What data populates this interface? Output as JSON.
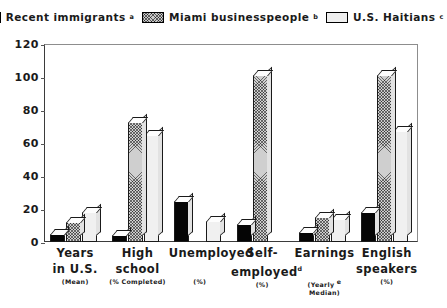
{
  "legend": {
    "entries": [
      {
        "label": "Recent immigrants",
        "sup": "a",
        "pattern": "solid-black",
        "color": "#000000"
      },
      {
        "label": "Miami businesspeople",
        "sup": "b",
        "pattern": "cross-hatch-gray",
        "color": "#c9c9c9"
      },
      {
        "label": "U.S. Haitians",
        "sup": "c",
        "pattern": "light-gray",
        "color": "#efefef"
      }
    ]
  },
  "yaxis": {
    "ticks": [
      "0",
      "20",
      "40",
      "60",
      "80",
      "100",
      "120"
    ],
    "min": 0,
    "max": 120
  },
  "categories": [
    {
      "line1": "Years",
      "line2": "in U.S.",
      "line3": "(Mean)",
      "sup": ""
    },
    {
      "line1": "High",
      "line2": "school",
      "line3": "(% Completed)",
      "sup": ""
    },
    {
      "line1": "Unemployed",
      "line2": "",
      "line3": "(%)",
      "sup": ""
    },
    {
      "line1": "Self-",
      "line2": "employed",
      "line3": "(%)",
      "sup": "d"
    },
    {
      "line1": "Earnings",
      "line2": "",
      "line3": "(Yearly\nMedian)",
      "sup": "e"
    },
    {
      "line1": "English",
      "line2": "speakers",
      "line3": "(%)",
      "sup": ""
    }
  ],
  "chart_data": {
    "type": "bar",
    "title": "",
    "xlabel": "",
    "ylabel": "",
    "ylim": [
      0,
      120
    ],
    "grid": false,
    "legend_position": "top-center",
    "categories": [
      "Years in U.S. (Mean)",
      "High school (% Completed)",
      "Unemployed (%)",
      "Self-employed (%)",
      "Earnings (Yearly Median)",
      "English speakers (%)"
    ],
    "series": [
      {
        "name": "Recent immigrants",
        "values": [
          5,
          4,
          25,
          11,
          6,
          18
        ]
      },
      {
        "name": "Miami businesspeople",
        "values": [
          12,
          73,
          0,
          101,
          15,
          101
        ]
      },
      {
        "name": "U.S. Haitians",
        "values": [
          18,
          65,
          13,
          0,
          14,
          67
        ]
      }
    ]
  }
}
